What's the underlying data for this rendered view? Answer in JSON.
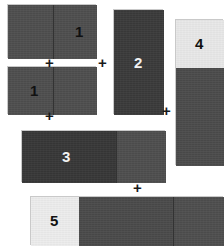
{
  "diagram": {
    "background": "#ffffff",
    "palette": {
      "dark": "#3a3a3a",
      "darker": "#333333",
      "mid": "#515151",
      "light": "#e8e8e8",
      "lighter": "#ededed",
      "outline": "#c9c9c9",
      "divider": "#2e2e2e",
      "label_light": "#f2f2f2",
      "label_dark": "#111111"
    },
    "operators": [
      {
        "id": "plus-1",
        "symbol": "+",
        "x": 45,
        "y": 55
      },
      {
        "id": "plus-2",
        "symbol": "+",
        "x": 98,
        "y": 55
      },
      {
        "id": "plus-3",
        "symbol": "+",
        "x": 45,
        "y": 108
      },
      {
        "id": "plus-4",
        "symbol": "+",
        "x": 162,
        "y": 103
      },
      {
        "id": "plus-5",
        "symbol": "+",
        "x": 133,
        "y": 180
      }
    ],
    "blocks": [
      {
        "id": "block-1a",
        "label": "1",
        "label_tone": "dark",
        "x": 7,
        "y": 4,
        "width": 89,
        "height": 54,
        "segments": [
          {
            "id": "seg-left",
            "x": 0,
            "y": 0,
            "width": 45,
            "height": 54,
            "color": "#4e4e4e"
          },
          {
            "id": "seg-right",
            "x": 45,
            "y": 0,
            "width": 44,
            "height": 54,
            "color": "#4e4e4e"
          }
        ],
        "dividers": [
          {
            "x": 45,
            "y": 0,
            "height": 54
          }
        ],
        "label_x": 67,
        "label_y": 19
      },
      {
        "id": "block-1b",
        "label": "1",
        "label_tone": "dark",
        "x": 7,
        "y": 66,
        "width": 89,
        "height": 48,
        "segments": [
          {
            "id": "seg-left",
            "x": 0,
            "y": 0,
            "width": 45,
            "height": 48,
            "color": "#4e4e4e"
          },
          {
            "id": "seg-right",
            "x": 45,
            "y": 0,
            "width": 44,
            "height": 48,
            "color": "#4e4e4e"
          }
        ],
        "dividers": [
          {
            "x": 45,
            "y": 0,
            "height": 48
          }
        ],
        "label_x": 22,
        "label_y": 16
      },
      {
        "id": "block-2",
        "label": "2",
        "label_tone": "light",
        "x": 113,
        "y": 9,
        "width": 50,
        "height": 105,
        "segments": [
          {
            "id": "seg-main",
            "x": 0,
            "y": 0,
            "width": 50,
            "height": 105,
            "color": "#3a3a3a"
          }
        ],
        "dividers": [],
        "label_x": 20,
        "label_y": 45
      },
      {
        "id": "block-4",
        "label": "4",
        "label_tone": "dark",
        "x": 175,
        "y": 19,
        "width": 48,
        "height": 146,
        "segments": [
          {
            "id": "seg-top",
            "x": 0,
            "y": 0,
            "width": 48,
            "height": 48,
            "color": "#e8e8e8"
          },
          {
            "id": "seg-bottom",
            "x": 0,
            "y": 48,
            "width": 48,
            "height": 98,
            "color": "#4b4b4b"
          }
        ],
        "dividers": [],
        "label_x": 19,
        "label_y": 16
      },
      {
        "id": "block-3",
        "label": "3",
        "label_tone": "light",
        "x": 21,
        "y": 130,
        "width": 144,
        "height": 52,
        "segments": [
          {
            "id": "seg-left",
            "x": 0,
            "y": 0,
            "width": 94,
            "height": 52,
            "color": "#373737"
          },
          {
            "id": "seg-right",
            "x": 94,
            "y": 0,
            "width": 50,
            "height": 52,
            "color": "#4e4e4e"
          }
        ],
        "dividers": [
          {
            "x": 94,
            "y": 0,
            "height": 52
          }
        ],
        "label_x": 40,
        "label_y": 18
      },
      {
        "id": "block-5",
        "label": "5",
        "label_tone": "dark",
        "x": 30,
        "y": 196,
        "width": 193,
        "height": 49,
        "segments": [
          {
            "id": "seg-light",
            "x": 0,
            "y": 0,
            "width": 48,
            "height": 49,
            "color": "#ededed"
          },
          {
            "id": "seg-mid",
            "x": 48,
            "y": 0,
            "width": 94,
            "height": 49,
            "color": "#4a4a4a"
          },
          {
            "id": "seg-right",
            "x": 142,
            "y": 0,
            "width": 51,
            "height": 49,
            "color": "#4e4e4e"
          }
        ],
        "dividers": [
          {
            "x": 142,
            "y": 0,
            "height": 49
          }
        ],
        "label_x": 19,
        "label_y": 16
      }
    ]
  }
}
